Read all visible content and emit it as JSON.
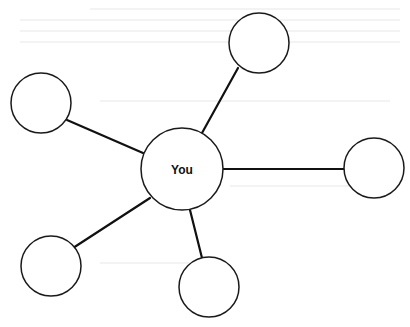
{
  "diagram": {
    "type": "star-network",
    "center": {
      "label": "You",
      "cx": 182,
      "cy": 169,
      "r": 41
    },
    "nodes": [
      {
        "id": "top",
        "label": "",
        "cx": 259,
        "cy": 43,
        "r": 30
      },
      {
        "id": "left-top",
        "label": "",
        "cx": 41,
        "cy": 103,
        "r": 30
      },
      {
        "id": "right",
        "label": "",
        "cx": 374,
        "cy": 168,
        "r": 30
      },
      {
        "id": "bottom-left",
        "label": "",
        "cx": 51,
        "cy": 266,
        "r": 30
      },
      {
        "id": "bottom",
        "label": "",
        "cx": 209,
        "cy": 287,
        "r": 30
      }
    ],
    "edges": [
      {
        "from": "center",
        "to": "top",
        "x1": 202,
        "y1": 133,
        "x2": 238,
        "y2": 68
      },
      {
        "from": "center",
        "to": "left-top",
        "x1": 143,
        "y1": 153,
        "x2": 67,
        "y2": 120
      },
      {
        "from": "center",
        "to": "right",
        "x1": 222,
        "y1": 169,
        "x2": 344,
        "y2": 169
      },
      {
        "from": "center",
        "to": "bottom-left",
        "x1": 150,
        "y1": 198,
        "x2": 73,
        "y2": 248
      },
      {
        "from": "center",
        "to": "bottom",
        "x1": 190,
        "y1": 210,
        "x2": 202,
        "y2": 258
      }
    ],
    "colors": {
      "stroke": "#111111",
      "fill": "#ffffff",
      "background": "#ffffff"
    }
  }
}
